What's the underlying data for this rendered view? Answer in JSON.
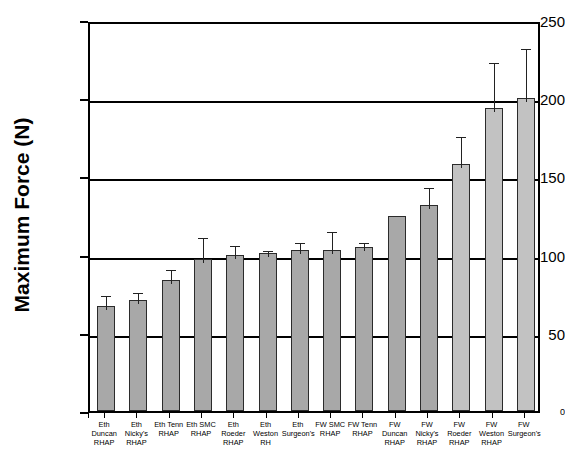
{
  "chart_data": {
    "type": "bar",
    "title": "",
    "xlabel": "",
    "ylabel": "Maximum Force (N)",
    "ylim": [
      0,
      250
    ],
    "yticks": [
      0,
      50,
      100,
      150,
      200,
      250
    ],
    "grid": true,
    "legend": "none",
    "categories": [
      "Eth Duncan RHAP",
      "Eth Nicky's RHAP",
      "Eth Tenn RHAP",
      "Eth SMC RHAP",
      "Eth Roeder RHAP",
      "Eth Weston RH",
      "Eth Surgeon's",
      "FW SMC RHAP",
      "FW Tenn RHAP",
      "FW Duncan RHAP",
      "FW Nicky's RHAP",
      "FW Roeder RHAP",
      "FW Weston RHAP",
      "FW Surgeon's"
    ],
    "category_lines": [
      [
        "Eth",
        "Duncan",
        "RHAP"
      ],
      [
        "Eth",
        "Nicky's",
        "RHAP"
      ],
      [
        "Eth Tenn",
        "RHAP"
      ],
      [
        "Eth SMC",
        "RHAP"
      ],
      [
        "Eth",
        "Roeder",
        "RHAP"
      ],
      [
        "Eth",
        "Weston",
        "RH"
      ],
      [
        "Eth",
        "Surgeon's"
      ],
      [
        "FW SMC",
        "RHAP"
      ],
      [
        "FW Tenn",
        "RHAP"
      ],
      [
        "FW",
        "Duncan",
        "RHAP"
      ],
      [
        "FW",
        "Nicky's",
        "RHAP"
      ],
      [
        "FW",
        "Roeder",
        "RHAP"
      ],
      [
        "FW",
        "Weston",
        "RHAP"
      ],
      [
        "FW",
        "Surgeon's"
      ]
    ],
    "values": [
      67,
      71,
      84,
      97,
      100,
      101,
      103,
      103,
      105,
      125,
      132,
      158,
      194,
      200
    ],
    "error_upper": [
      9,
      7,
      9,
      16,
      8,
      4,
      7,
      14,
      5,
      0,
      13,
      20,
      31,
      34
    ],
    "series": [
      {
        "name": "Maximum Force",
        "values": [
          67,
          71,
          84,
          97,
          100,
          101,
          103,
          103,
          105,
          125,
          132,
          158,
          194,
          200
        ]
      }
    ]
  },
  "style": {
    "bar_fill": "#a8a8a8",
    "bar_fill_light": "#c2c2c2",
    "bar_edge": "#2b2b2b",
    "axis_color": "#000000",
    "background": "#ffffff"
  },
  "axis": {
    "y_title": "Maximum Force (N)",
    "y_tick_labels": [
      "250",
      "200",
      "150",
      "100",
      "50",
      "0"
    ]
  }
}
